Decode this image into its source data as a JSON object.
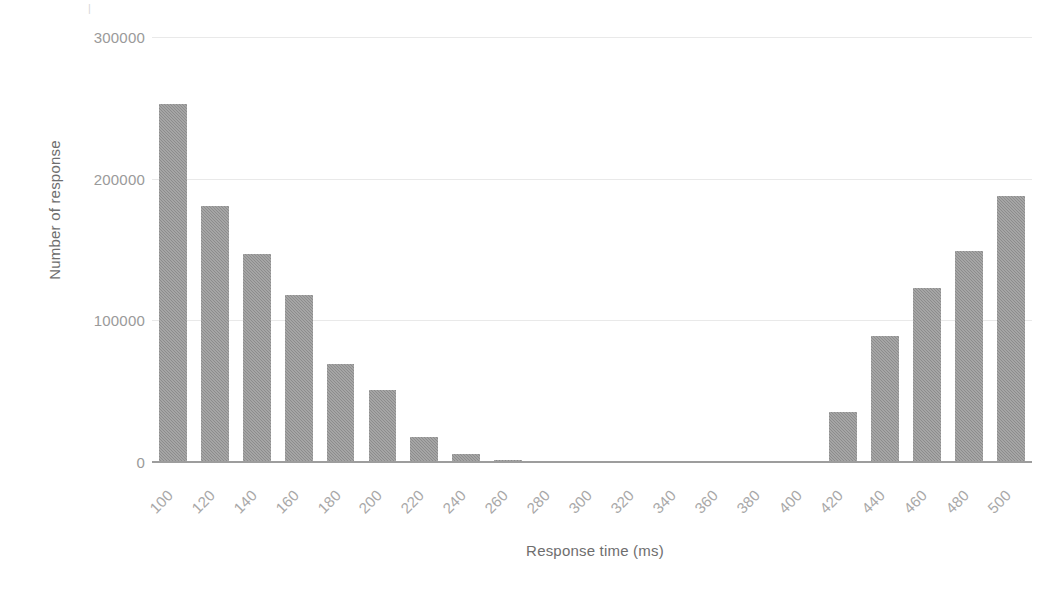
{
  "chart_data": {
    "type": "bar",
    "title": "",
    "xlabel": "Response time (ms)",
    "ylabel": "Number of response",
    "categories": [
      "100",
      "120",
      "140",
      "160",
      "180",
      "200",
      "220",
      "240",
      "260",
      "280",
      "300",
      "320",
      "340",
      "360",
      "380",
      "400",
      "420",
      "440",
      "460",
      "480",
      "500"
    ],
    "values": [
      253000,
      181000,
      147000,
      118000,
      69000,
      51000,
      18000,
      5500,
      1500,
      0,
      0,
      0,
      0,
      0,
      0,
      0,
      35000,
      89000,
      123000,
      149000,
      188000
    ],
    "ylim": [
      0,
      300000
    ],
    "yticks": [
      0,
      100000,
      200000,
      300000
    ],
    "ytick_labels": [
      "0",
      "100000",
      "200000",
      "300000"
    ],
    "grid": true,
    "grid_axis": "y",
    "legend": false,
    "bar_color": "#8c8c8c",
    "grid_color": "#e9e9e9",
    "axis_color": "#9d9d9d",
    "tick_label_color": "#a8a8a8",
    "axis_title_color": "#6e6e6e",
    "xtick_rotation": 45
  },
  "axes": {
    "x_title": "Response time (ms)",
    "y_title": "Number of response"
  },
  "misc": {
    "top_stray_mark": "|"
  }
}
